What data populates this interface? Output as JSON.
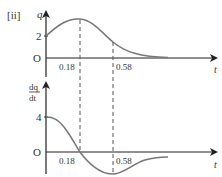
{
  "part_label": "[ii]",
  "top_graph": {
    "y_label": "q",
    "x_label": "t",
    "origin_label": "O",
    "y_tick": "2",
    "x_ticks": [
      "0.18",
      "0.58"
    ]
  },
  "bottom_graph": {
    "y_label_num": "dq",
    "y_label_den": "dt",
    "x_label": "t",
    "origin_label": "O",
    "y_tick": "4",
    "x_ticks": [
      "0.18",
      "0.58"
    ]
  },
  "colors": {
    "axis": "#222222",
    "curve": "#777777",
    "dashed": "#555555",
    "text": "#333333"
  }
}
